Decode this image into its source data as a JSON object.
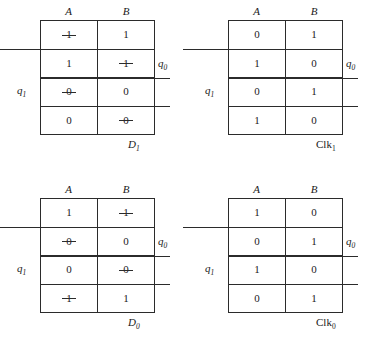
{
  "figure": {
    "title": "Karnaugh maps for D and Clk excitation equations",
    "column_headers": [
      "A",
      "B"
    ],
    "row_marker_labels": {
      "q0": "q",
      "q0_sub": "0",
      "q1": "q",
      "q1_sub": "1"
    }
  },
  "maps": [
    {
      "id": "D1",
      "position": "top-left",
      "label": "D",
      "label_sub": "1",
      "label_italic": true,
      "headers": [
        "A",
        "B"
      ],
      "rows": [
        [
          {
            "value": "1",
            "struck": true
          },
          {
            "value": "1",
            "struck": false
          }
        ],
        [
          {
            "value": "1",
            "struck": false
          },
          {
            "value": "1",
            "struck": true
          }
        ],
        [
          {
            "value": "0",
            "struck": true
          },
          {
            "value": "0",
            "struck": false
          }
        ],
        [
          {
            "value": "0",
            "struck": false
          },
          {
            "value": "0",
            "struck": true
          }
        ]
      ]
    },
    {
      "id": "Clk1",
      "position": "top-right",
      "label": "Clk",
      "label_sub": "1",
      "label_italic": false,
      "headers": [
        "A",
        "B"
      ],
      "rows": [
        [
          {
            "value": "0",
            "struck": false
          },
          {
            "value": "1",
            "struck": false
          }
        ],
        [
          {
            "value": "1",
            "struck": false
          },
          {
            "value": "0",
            "struck": false
          }
        ],
        [
          {
            "value": "0",
            "struck": false
          },
          {
            "value": "1",
            "struck": false
          }
        ],
        [
          {
            "value": "1",
            "struck": false
          },
          {
            "value": "0",
            "struck": false
          }
        ]
      ]
    },
    {
      "id": "D0",
      "position": "bottom-left",
      "label": "D",
      "label_sub": "0",
      "label_italic": true,
      "headers": [
        "A",
        "B"
      ],
      "rows": [
        [
          {
            "value": "1",
            "struck": false
          },
          {
            "value": "1",
            "struck": true
          }
        ],
        [
          {
            "value": "0",
            "struck": true
          },
          {
            "value": "0",
            "struck": false
          }
        ],
        [
          {
            "value": "0",
            "struck": false
          },
          {
            "value": "0",
            "struck": true
          }
        ],
        [
          {
            "value": "1",
            "struck": true
          },
          {
            "value": "1",
            "struck": false
          }
        ]
      ]
    },
    {
      "id": "Clk0",
      "position": "bottom-right",
      "label": "Clk",
      "label_sub": "0",
      "label_italic": false,
      "headers": [
        "A",
        "B"
      ],
      "rows": [
        [
          {
            "value": "1",
            "struck": false
          },
          {
            "value": "0",
            "struck": false
          }
        ],
        [
          {
            "value": "0",
            "struck": false
          },
          {
            "value": "1",
            "struck": false
          }
        ],
        [
          {
            "value": "1",
            "struck": false
          },
          {
            "value": "0",
            "struck": false
          }
        ],
        [
          {
            "value": "0",
            "struck": false
          },
          {
            "value": "1",
            "struck": false
          }
        ]
      ]
    }
  ],
  "colors": {
    "ink": "#2b2b2b",
    "background": "#ffffff"
  }
}
